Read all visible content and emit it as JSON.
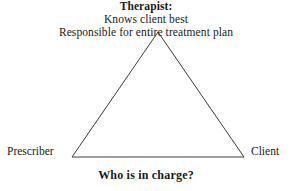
{
  "diagram": {
    "type": "triangle",
    "apex": {
      "title": "Therapist:",
      "line2": "Knows client best",
      "line3": "Responsible for entire treatment plan"
    },
    "vertices": {
      "left_label": "Prescriber",
      "right_label": "Client"
    },
    "caption": "Who is in charge?",
    "geometry": {
      "apex_x": 158,
      "apex_y": 32,
      "base_left_x": 72,
      "base_right_x": 244,
      "base_y": 157
    },
    "colors": {
      "line": "#3c3c3c",
      "text": "#1a1a1a",
      "background": "#ffffff"
    }
  }
}
